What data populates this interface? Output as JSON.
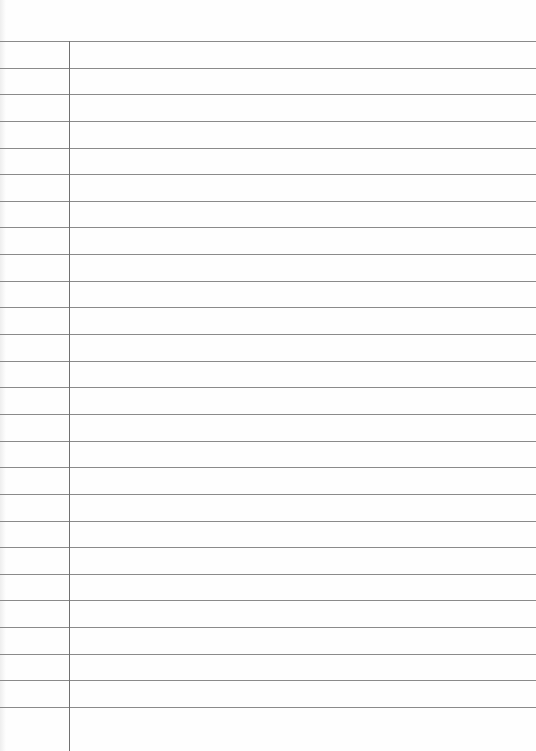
{
  "paper": {
    "type": "ruled-notebook-page",
    "rule_count": 26,
    "first_rule_y": 41,
    "rule_spacing": 26.64,
    "margin_x": 69,
    "colors": {
      "background": "#fefefe",
      "rule": "#8a8a8a",
      "margin": "#707070"
    }
  }
}
